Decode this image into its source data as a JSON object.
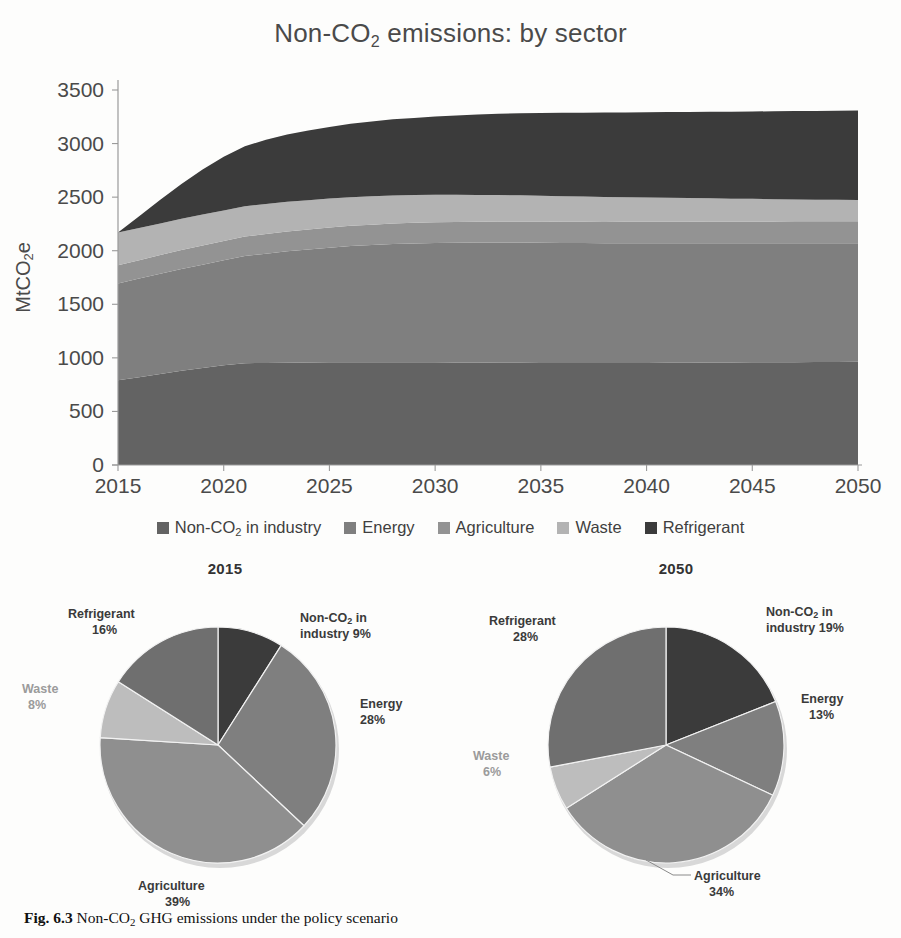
{
  "figure": {
    "title_prefix": "Non-CO",
    "title_sub": "2",
    "title_suffix": " emissions: by sector",
    "caption_label": "Fig. 6.3",
    "caption_text_a": "Non-CO",
    "caption_sub": "2",
    "caption_text_b": " GHG emissions under the policy scenario"
  },
  "colors": {
    "industry": "#636363",
    "energy": "#7f7f7f",
    "agriculture": "#939393",
    "waste": "#b3b3b3",
    "refrigerant": "#3b3b3b",
    "axis": "#9a9a9a",
    "text": "#4a4a4a",
    "background": "#fdfdfc"
  },
  "legend": {
    "items": [
      {
        "label_pre": "Non-CO",
        "label_sub": "2",
        "label_post": " in industry",
        "key": "industry"
      },
      {
        "label_pre": "Energy",
        "label_sub": "",
        "label_post": "",
        "key": "energy"
      },
      {
        "label_pre": "Agriculture",
        "label_sub": "",
        "label_post": "",
        "key": "agriculture"
      },
      {
        "label_pre": "Waste",
        "label_sub": "",
        "label_post": "",
        "key": "waste"
      },
      {
        "label_pre": "Refrigerant",
        "label_sub": "",
        "label_post": "",
        "key": "refrigerant"
      }
    ]
  },
  "chart_data": [
    {
      "type": "area",
      "stacked": true,
      "title": "Non-CO2 emissions: by sector",
      "xlabel": "",
      "ylabel": "MtCO2e",
      "ylabel_pre": "MtCO",
      "ylabel_sub": "2",
      "ylabel_post": "e",
      "xlim": [
        2015,
        2050
      ],
      "ylim": [
        0,
        3500
      ],
      "ytick_step": 500,
      "xtick_step": 5,
      "yticks": [
        0,
        500,
        1000,
        1500,
        2000,
        2500,
        3000,
        3500
      ],
      "xticks": [
        2015,
        2020,
        2025,
        2030,
        2035,
        2040,
        2045,
        2050
      ],
      "grid": false,
      "legend_position": "bottom",
      "x": [
        2015,
        2016,
        2017,
        2018,
        2019,
        2020,
        2021,
        2022,
        2023,
        2024,
        2025,
        2026,
        2027,
        2028,
        2029,
        2030,
        2031,
        2032,
        2033,
        2034,
        2035,
        2036,
        2037,
        2038,
        2039,
        2040,
        2041,
        2042,
        2043,
        2044,
        2045,
        2046,
        2047,
        2048,
        2049,
        2050
      ],
      "series": [
        {
          "name": "Non-CO2 in industry",
          "color": "#636363",
          "values": [
            790,
            820,
            850,
            880,
            905,
            930,
            950,
            952,
            954,
            956,
            958,
            958,
            958,
            958,
            958,
            958,
            957,
            956,
            955,
            954,
            953,
            952,
            951,
            951,
            952,
            953,
            954,
            955,
            956,
            957,
            958,
            959,
            960,
            961,
            962,
            963
          ]
        },
        {
          "name": "Energy",
          "color": "#7f7f7f",
          "values": [
            905,
            920,
            935,
            950,
            965,
            980,
            1000,
            1020,
            1040,
            1055,
            1070,
            1085,
            1095,
            1105,
            1110,
            1115,
            1118,
            1120,
            1122,
            1122,
            1122,
            1121,
            1120,
            1119,
            1118,
            1117,
            1116,
            1115,
            1114,
            1113,
            1112,
            1111,
            1110,
            1109,
            1108,
            1107
          ]
        },
        {
          "name": "Agriculture",
          "color": "#939393",
          "values": [
            170,
            172,
            174,
            176,
            178,
            180,
            182,
            184,
            186,
            187,
            188,
            189,
            190,
            191,
            192,
            193,
            194,
            195,
            196,
            197,
            198,
            198,
            199,
            199,
            200,
            200,
            201,
            201,
            202,
            202,
            203,
            203,
            204,
            204,
            205,
            205
          ]
        },
        {
          "name": "Waste",
          "color": "#b3b3b3",
          "values": [
            305,
            300,
            296,
            292,
            289,
            286,
            283,
            280,
            277,
            274,
            271,
            268,
            265,
            262,
            259,
            256,
            253,
            250,
            247,
            244,
            241,
            238,
            235,
            232,
            229,
            226,
            223,
            220,
            217,
            214,
            211,
            208,
            205,
            202,
            200,
            198
          ]
        },
        {
          "name": "Refrigerant",
          "color": "#3b3b3b",
          "values": [
            0,
            110,
            220,
            325,
            420,
            500,
            560,
            600,
            628,
            650,
            668,
            684,
            698,
            710,
            720,
            730,
            740,
            750,
            758,
            766,
            772,
            778,
            783,
            788,
            792,
            796,
            800,
            804,
            808,
            812,
            816,
            820,
            824,
            828,
            832,
            836
          ]
        }
      ],
      "totals_note": {
        "2015": 2170,
        "2050": 3145
      }
    },
    {
      "type": "pie",
      "title": "2015",
      "labels": [
        "Non-CO2 in industry",
        "Energy",
        "Agriculture",
        "Waste",
        "Refrigerant"
      ],
      "values": [
        9,
        28,
        39,
        8,
        16
      ],
      "unit": "%",
      "colors": [
        "#3b3b3b",
        "#7f7f7f",
        "#8f8f8f",
        "#bdbdbd",
        "#6f6f6f"
      ],
      "slice_labels": [
        {
          "line1_pre": "Non-CO",
          "line1_sub": "2",
          "line1_post": " in",
          "line2": "industry 9%",
          "muted": false
        },
        {
          "line1_pre": "Energy",
          "line1_sub": "",
          "line1_post": "",
          "line2": "28%",
          "muted": false
        },
        {
          "line1_pre": "Agriculture",
          "line1_sub": "",
          "line1_post": "",
          "line2": "39%",
          "muted": false
        },
        {
          "line1_pre": "Waste",
          "line1_sub": "",
          "line1_post": "",
          "line2": "8%",
          "muted": true
        },
        {
          "line1_pre": "Refrigerant",
          "line1_sub": "",
          "line1_post": "",
          "line2": "16%",
          "muted": false
        }
      ]
    },
    {
      "type": "pie",
      "title": "2050",
      "labels": [
        "Non-CO2 in industry",
        "Energy",
        "Agriculture",
        "Waste",
        "Refrigerant"
      ],
      "values": [
        19,
        13,
        34,
        6,
        28
      ],
      "unit": "%",
      "colors": [
        "#3b3b3b",
        "#7f7f7f",
        "#8f8f8f",
        "#bdbdbd",
        "#6f6f6f"
      ],
      "slice_labels": [
        {
          "line1_pre": "Non-CO",
          "line1_sub": "2",
          "line1_post": " in",
          "line2": "industry 19%",
          "muted": false
        },
        {
          "line1_pre": "Energy",
          "line1_sub": "",
          "line1_post": "",
          "line2": "13%",
          "muted": false
        },
        {
          "line1_pre": "Agriculture",
          "line1_sub": "",
          "line1_post": "",
          "line2": "34%",
          "muted": false
        },
        {
          "line1_pre": "Waste",
          "line1_sub": "",
          "line1_post": "",
          "line2": "6%",
          "muted": true
        },
        {
          "line1_pre": "Refrigerant",
          "line1_sub": "",
          "line1_post": "",
          "line2": "28%",
          "muted": false
        }
      ]
    }
  ]
}
